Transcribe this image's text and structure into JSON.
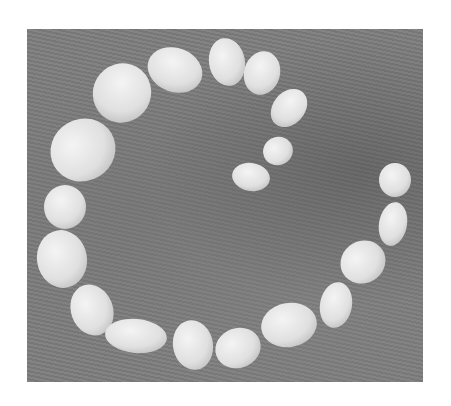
{
  "image": {
    "description": "Grayscale photograph of smooth pebbles arranged in a spiral on a weathered wooden surface",
    "colors": {
      "background": "#ffffff",
      "surface": "#7d7d7d",
      "stone": "#e6e6e6",
      "stone_shade": "#cfcfcf",
      "spot": "#8a8a8a"
    },
    "stones": [
      {
        "cx": 175,
        "cy": 70,
        "rx": 28,
        "ry": 22,
        "rot": 20
      },
      {
        "cx": 227,
        "cy": 62,
        "rx": 18,
        "ry": 24,
        "rot": -10
      },
      {
        "cx": 262,
        "cy": 73,
        "rx": 18,
        "ry": 22,
        "rot": 15
      },
      {
        "cx": 122,
        "cy": 93,
        "rx": 29,
        "ry": 30,
        "rot": 30
      },
      {
        "cx": 289,
        "cy": 108,
        "rx": 16,
        "ry": 21,
        "rot": 40
      },
      {
        "cx": 83,
        "cy": 150,
        "rx": 33,
        "ry": 31,
        "rot": -30
      },
      {
        "cx": 278,
        "cy": 151,
        "rx": 15,
        "ry": 14,
        "rot": -20
      },
      {
        "cx": 251,
        "cy": 177,
        "rx": 19,
        "ry": 14,
        "rot": 10
      },
      {
        "cx": 395,
        "cy": 180,
        "rx": 16,
        "ry": 17,
        "rot": 0
      },
      {
        "cx": 65,
        "cy": 207,
        "rx": 21,
        "ry": 22,
        "rot": 0
      },
      {
        "cx": 393,
        "cy": 224,
        "rx": 14,
        "ry": 22,
        "rot": 10
      },
      {
        "cx": 62,
        "cy": 259,
        "rx": 25,
        "ry": 29,
        "rot": -10
      },
      {
        "cx": 363,
        "cy": 262,
        "rx": 23,
        "ry": 21,
        "rot": -30
      },
      {
        "cx": 92,
        "cy": 310,
        "rx": 21,
        "ry": 26,
        "rot": -20
      },
      {
        "cx": 336,
        "cy": 305,
        "rx": 16,
        "ry": 23,
        "rot": 10
      },
      {
        "cx": 289,
        "cy": 325,
        "rx": 28,
        "ry": 22,
        "rot": -10
      },
      {
        "cx": 136,
        "cy": 336,
        "rx": 31,
        "ry": 17,
        "rot": 5
      },
      {
        "cx": 193,
        "cy": 345,
        "rx": 20,
        "ry": 25,
        "rot": -10
      },
      {
        "cx": 238,
        "cy": 348,
        "rx": 23,
        "ry": 20,
        "rot": -20
      }
    ]
  }
}
